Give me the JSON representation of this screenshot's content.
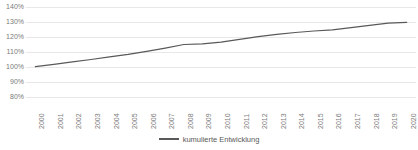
{
  "chart_data": {
    "type": "line",
    "title": "",
    "xlabel": "",
    "ylabel": "",
    "grid": true,
    "legend_position": "bottom",
    "ylim": [
      80,
      140
    ],
    "ytick_labels": [
      "140%",
      "130%",
      "120%",
      "110%",
      "100%",
      "90%",
      "80%"
    ],
    "ytick_values": [
      140,
      130,
      120,
      110,
      100,
      90,
      80
    ],
    "categories": [
      "2000",
      "2001",
      "2002",
      "2003",
      "2004",
      "2005",
      "2006",
      "2007",
      "2008",
      "2009",
      "2010",
      "2011",
      "2012",
      "2013",
      "2014",
      "2015",
      "2016",
      "2017",
      "2018",
      "2019",
      "2020"
    ],
    "series": [
      {
        "name": "kumulierte Entwicklung",
        "color": "#595959",
        "values": [
          100.3,
          101.8,
          103.4,
          105.0,
          106.7,
          108.4,
          110.4,
          112.6,
          115.0,
          115.4,
          116.6,
          118.4,
          120.2,
          121.7,
          123.0,
          124.0,
          124.8,
          126.2,
          127.8,
          129.3,
          129.8
        ]
      }
    ]
  },
  "legend": {
    "entries": [
      {
        "label": "kumulierte Entwicklung",
        "color": "#595959"
      }
    ]
  },
  "colors": {
    "series_line": "#595959",
    "gridline": "#e8e8e8",
    "axis_text": "#7a7a7a",
    "background": "#ffffff"
  }
}
